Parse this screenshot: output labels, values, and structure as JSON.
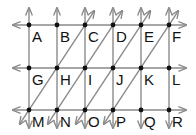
{
  "diagram": {
    "type": "grid of parallel lines with labeled intersection points",
    "line_color": "#8a8a8a",
    "point_color": "#111111",
    "columns_x": [
      29,
      57,
      85,
      113,
      141,
      169
    ],
    "rows_y": [
      25,
      68,
      110
    ],
    "points": [
      {
        "label": "A",
        "col": 0,
        "row": 0
      },
      {
        "label": "B",
        "col": 1,
        "row": 0
      },
      {
        "label": "C",
        "col": 2,
        "row": 0
      },
      {
        "label": "D",
        "col": 3,
        "row": 0
      },
      {
        "label": "E",
        "col": 4,
        "row": 0
      },
      {
        "label": "F",
        "col": 5,
        "row": 0
      },
      {
        "label": "G",
        "col": 0,
        "row": 1
      },
      {
        "label": "H",
        "col": 1,
        "row": 1
      },
      {
        "label": "I",
        "col": 2,
        "row": 1
      },
      {
        "label": "J",
        "col": 3,
        "row": 1
      },
      {
        "label": "K",
        "col": 4,
        "row": 1
      },
      {
        "label": "L",
        "col": 5,
        "row": 1
      },
      {
        "label": "M",
        "col": 0,
        "row": 2
      },
      {
        "label": "N",
        "col": 1,
        "row": 2
      },
      {
        "label": "O",
        "col": 2,
        "row": 2
      },
      {
        "label": "P",
        "col": 3,
        "row": 2
      },
      {
        "label": "Q",
        "col": 4,
        "row": 2
      },
      {
        "label": "R",
        "col": 5,
        "row": 2
      }
    ],
    "diagonals": [
      {
        "through": [
          "M",
          "H",
          "C"
        ]
      },
      {
        "through": [
          "N",
          "I",
          "D"
        ]
      },
      {
        "through": [
          "O",
          "J",
          "E"
        ]
      },
      {
        "through": [
          "P",
          "K",
          "F"
        ]
      }
    ]
  }
}
